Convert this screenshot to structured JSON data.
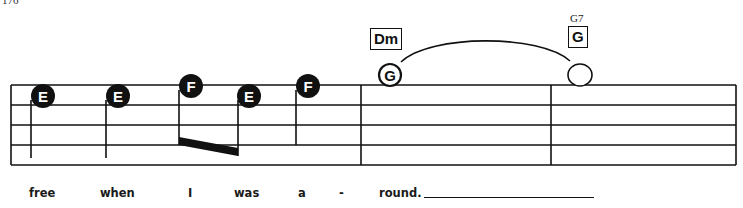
{
  "page": {
    "number": "176"
  },
  "score": {
    "staff": {
      "lines": 5,
      "top_y": 85,
      "spacing": 20,
      "x_start": 11,
      "x_end": 736
    },
    "barlines_x": [
      11,
      361,
      551,
      736
    ],
    "measures": [
      {
        "notes": [
          {
            "letter": "E",
            "x": 43,
            "y": 96,
            "style": "filled",
            "stem": "down"
          },
          {
            "letter": "E",
            "x": 118,
            "y": 96,
            "style": "filled",
            "stem": "down"
          },
          {
            "letter": "F",
            "x": 191,
            "y": 86,
            "style": "filled",
            "stem": "down",
            "beam": "start"
          },
          {
            "letter": "E",
            "x": 249,
            "y": 96,
            "style": "filled",
            "stem": "down",
            "beam": "end"
          },
          {
            "letter": "F",
            "x": 308,
            "y": 86,
            "style": "filled",
            "stem": "down"
          }
        ]
      },
      {
        "chord": {
          "label": "Dm"
        },
        "notes": [
          {
            "letter": "G",
            "x": 390,
            "y": 75,
            "style": "open-whole"
          }
        ]
      },
      {
        "chord": {
          "label": "G",
          "alt": "G7"
        },
        "notes": [
          {
            "letter": "",
            "x": 580,
            "y": 75,
            "style": "open-whole"
          }
        ]
      }
    ],
    "tie": {
      "from": "G (Dm)",
      "to": "whole note (G7)"
    }
  },
  "lyrics": [
    {
      "text": "free",
      "x": 29
    },
    {
      "text": "when",
      "x": 100
    },
    {
      "text": "I",
      "x": 188
    },
    {
      "text": "was",
      "x": 234
    },
    {
      "text": "a",
      "x": 298
    },
    {
      "text": "-",
      "x": 339
    },
    {
      "text": "round.",
      "x": 379
    }
  ]
}
